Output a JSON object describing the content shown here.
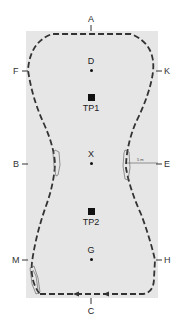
{
  "arena": {
    "background": "#e6e6e6",
    "path_color": "#333333"
  },
  "letters": {
    "A": "A",
    "K": "K",
    "E": "E",
    "H": "H",
    "C": "C",
    "M": "M",
    "B": "B",
    "F": "F"
  },
  "centre_line": {
    "D": "D",
    "X": "X",
    "G": "G"
  },
  "points": {
    "TP1": "TP1",
    "TP2": "TP2"
  },
  "distance_label": "5 m"
}
